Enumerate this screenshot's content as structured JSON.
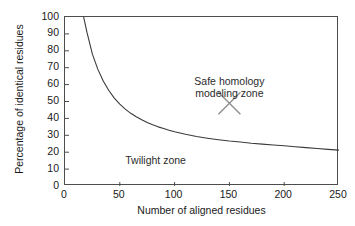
{
  "chart_data": {
    "type": "line",
    "title": "",
    "xlabel": "Number of aligned residues",
    "ylabel": "Percentage of identical residues",
    "xlim": [
      0,
      250
    ],
    "ylim": [
      0,
      100
    ],
    "xticks": [
      "0",
      "50",
      "100",
      "150",
      "200",
      "250"
    ],
    "xtick_values": [
      0,
      50,
      100,
      150,
      200,
      250
    ],
    "yticks": [
      "0",
      "10",
      "20",
      "30",
      "40",
      "50",
      "60",
      "70",
      "80",
      "90",
      "100"
    ],
    "ytick_values": [
      0,
      10,
      20,
      30,
      40,
      50,
      60,
      70,
      80,
      90,
      100
    ],
    "grid": false,
    "legend": "none",
    "series": [
      {
        "name": "Twilight zone boundary",
        "x": [
          17,
          20,
          25,
          30,
          35,
          40,
          45,
          50,
          55,
          60,
          65,
          70,
          75,
          80,
          85,
          90,
          95,
          100,
          110,
          120,
          130,
          140,
          150,
          160,
          170,
          180,
          190,
          200,
          210,
          220,
          230,
          240,
          250
        ],
        "y": [
          100,
          91,
          78,
          69,
          62,
          56.5,
          52,
          48.5,
          45.5,
          43,
          41,
          39.2,
          37.6,
          36.2,
          35,
          34,
          33,
          32.1,
          30.6,
          29.3,
          28.3,
          27.4,
          26.6,
          26,
          25.3,
          24.8,
          24.3,
          23.8,
          23.2,
          22.7,
          22.2,
          21.7,
          21.2
        ]
      }
    ],
    "annotations": [
      {
        "name": "safe-homology-modeling-zone",
        "text_line1": "Safe homology",
        "text_line2": "modeling zone",
        "x": 150,
        "y": 58,
        "marker": "x-cross",
        "marker_x": 150,
        "marker_y": 49
      },
      {
        "name": "twilight-zone",
        "text_line1": "Twilight zone",
        "x": 55,
        "y": 15
      }
    ],
    "colors": {
      "curve": "#3a3a3a",
      "frame": "#4d4d4d",
      "text": "#1a1a1a",
      "marker": "#8c8c8c",
      "background": "#ffffff"
    }
  }
}
